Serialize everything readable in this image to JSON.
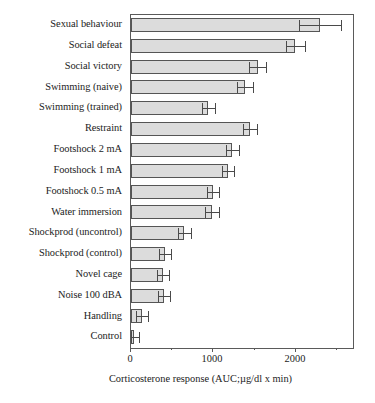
{
  "chart_data": {
    "type": "bar",
    "orientation": "horizontal",
    "title": "",
    "xlabel": "Corticosterone response (AUC;µg/dl x min)",
    "ylabel": "",
    "xlim": [
      0,
      2700
    ],
    "xticks": [
      0,
      1000,
      2000
    ],
    "xticklabels": [
      "0",
      "1000",
      "2000"
    ],
    "xminorticks": [
      500,
      1500,
      2500
    ],
    "grid": false,
    "legend": null,
    "bar_fill_color": "#dcdcdc",
    "bar_edge_color": "#555555",
    "error_bar_type": "sem",
    "categories": [
      "Sexual behaviour",
      "Social defeat",
      "Social victory",
      "Swimming (naive)",
      "Swimming (trained)",
      "Restraint",
      "Footshock 2 mA",
      "Footshock 1 mA",
      "Footshock 0.5 mA",
      "Water immersion",
      "Shockprod (uncontrol)",
      "Shockprod (control)",
      "Novel cage",
      "Noise 100 dBA",
      "Handling",
      "Control"
    ],
    "values": [
      2300,
      2000,
      1540,
      1390,
      940,
      1450,
      1230,
      1180,
      1000,
      990,
      650,
      410,
      390,
      400,
      135,
      35
    ],
    "errors": [
      260,
      115,
      100,
      95,
      80,
      85,
      80,
      75,
      70,
      85,
      80,
      75,
      70,
      75,
      70,
      60
    ],
    "series": [
      {
        "name": "Corticosterone response",
        "values": [
          2300,
          2000,
          1540,
          1390,
          940,
          1450,
          1230,
          1180,
          1000,
          990,
          650,
          410,
          390,
          400,
          135,
          35
        ],
        "errors": [
          260,
          115,
          100,
          95,
          80,
          85,
          80,
          75,
          70,
          85,
          80,
          75,
          70,
          75,
          70,
          60
        ]
      }
    ]
  },
  "axis": {
    "xlabel": "Corticosterone response (AUC;µg/dl x min)",
    "tick0": "0",
    "tick1": "1000",
    "tick2": "2000"
  }
}
